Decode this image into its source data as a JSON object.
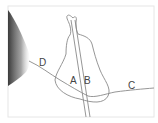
{
  "diagram": {
    "labels": {
      "A": "A",
      "B": "B",
      "C": "C",
      "D": "D"
    },
    "colors": {
      "line": "#8a8a8a",
      "frame": "#e4e4e4",
      "shadow": "#555555"
    }
  }
}
